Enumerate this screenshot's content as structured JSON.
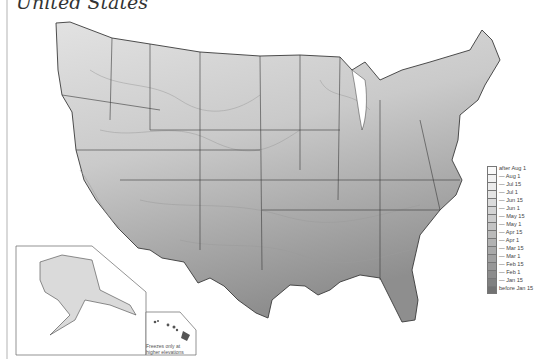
{
  "map": {
    "title": "United States",
    "subject": "Average date of last spring freeze",
    "regions": {
      "main": "Contiguous United States",
      "inset_alaska": "Alaska",
      "inset_hawaii": "Hawaii"
    },
    "hawaii_note_line1": "Freezes only at",
    "hawaii_note_line2": "higher elevations",
    "colors": {
      "lightest": "#f4f4f4",
      "darkest": "#6e6e6e",
      "border": "#3a3a3a",
      "frame": "#d9d9d9"
    }
  },
  "legend": {
    "items": [
      {
        "label": "after Aug 1",
        "color": "#fafafa"
      },
      {
        "label": "— Aug 1",
        "color": "#f2f2f2"
      },
      {
        "label": "— Jul 15",
        "color": "#ebebeb"
      },
      {
        "label": "— Jul 1",
        "color": "#e4e4e4"
      },
      {
        "label": "— Jun 15",
        "color": "#dcdcdc"
      },
      {
        "label": "— Jun 1",
        "color": "#d4d4d4"
      },
      {
        "label": "— May 15",
        "color": "#cccccc"
      },
      {
        "label": "— May 1",
        "color": "#c3c3c3"
      },
      {
        "label": "— Apr 15",
        "color": "#bababa"
      },
      {
        "label": "— Apr 1",
        "color": "#b2b2b2"
      },
      {
        "label": "— Mar 15",
        "color": "#a9a9a9"
      },
      {
        "label": "— Mar 1",
        "color": "#a0a0a0"
      },
      {
        "label": "— Feb 15",
        "color": "#979797"
      },
      {
        "label": "— Feb 1",
        "color": "#8c8c8c"
      },
      {
        "label": "— Jan 15",
        "color": "#808080"
      },
      {
        "label": "before Jan 15",
        "color": "#727272"
      }
    ]
  }
}
